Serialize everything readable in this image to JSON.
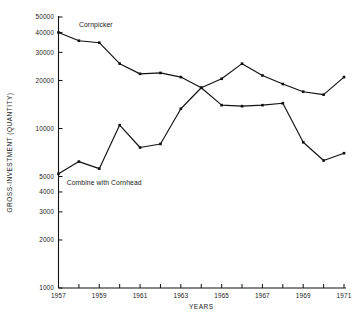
{
  "chart_data": {
    "type": "line",
    "title": "",
    "xlabel": "YEARS",
    "ylabel": "GROSS-INVESTMENT (QUANTITY)",
    "yscale": "log",
    "ylim": [
      1000,
      50000
    ],
    "xlim": [
      1957,
      1971
    ],
    "grid": false,
    "legend_position": "inline-annotation",
    "ytick_labels": [
      "1000",
      "2000",
      "3000",
      "4000",
      "5000",
      "10000",
      "20000",
      "30000",
      "40000",
      "50000"
    ],
    "ytick_values": [
      1000,
      2000,
      3000,
      4000,
      5000,
      10000,
      20000,
      30000,
      40000,
      50000
    ],
    "xtick_labels": [
      "1957",
      "1959",
      "1961",
      "1963",
      "1965",
      "1967",
      "1969",
      "1971"
    ],
    "xtick_values": [
      1957,
      1959,
      1961,
      1963,
      1965,
      1967,
      1969,
      1971
    ],
    "x": [
      1957,
      1958,
      1959,
      1960,
      1961,
      1962,
      1963,
      1964,
      1965,
      1966,
      1967,
      1968,
      1969,
      1970,
      1971
    ],
    "series": [
      {
        "name": "Cornpicker",
        "label": "Cornpicker",
        "color": "#111111",
        "values": [
          40000,
          35500,
          34500,
          25500,
          22000,
          22300,
          21000,
          18000,
          14000,
          13800,
          14000,
          14400,
          8200,
          6300,
          7000
        ]
      },
      {
        "name": "Combine with Cornhead",
        "label": "Combine with Cornhead",
        "color": "#111111",
        "values": [
          5200,
          6200,
          5600,
          10500,
          7600,
          8000,
          13300,
          18000,
          20500,
          25500,
          21500,
          19000,
          17000,
          16300,
          21000
        ]
      }
    ],
    "annotations": [
      {
        "text": "Cornpicker",
        "x": 1958.0,
        "y": 43000
      },
      {
        "text": "Combine with Cornhead",
        "x": 1957.4,
        "y": 4450
      }
    ]
  },
  "figure": {
    "background_color": "#ffffff",
    "ink_color": "#111111"
  }
}
